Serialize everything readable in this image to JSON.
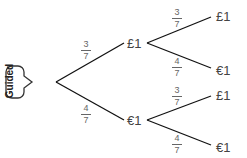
{
  "badge": {
    "label": "Guided"
  },
  "tree": {
    "first": [
      {
        "outcome": "£1",
        "prob_num": "3",
        "prob_den": "7"
      },
      {
        "outcome": "€1",
        "prob_num": "4",
        "prob_den": "7"
      }
    ],
    "second_after_pound": [
      {
        "outcome": "£1",
        "prob_num": "3",
        "prob_den": "7"
      },
      {
        "outcome": "€1",
        "prob_num": "4",
        "prob_den": "7"
      }
    ],
    "second_after_euro": [
      {
        "outcome": "£1",
        "prob_num": "3",
        "prob_den": "7"
      },
      {
        "outcome": "€1",
        "prob_num": "4",
        "prob_den": "7"
      }
    ]
  }
}
